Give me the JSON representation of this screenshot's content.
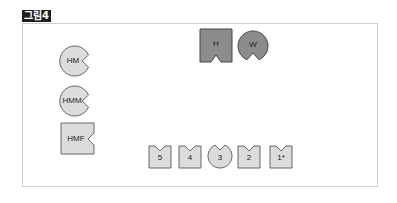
{
  "figure_label": "그림4",
  "colors": {
    "dark_fill": "#8c8c8c",
    "light_fill": "#dcdcdc",
    "stroke": "#555555",
    "frame": "#cfcfcf"
  },
  "top_pieces": [
    {
      "id": "H",
      "label": "H",
      "shape": "square-notch-bottom",
      "fill": "dark"
    },
    {
      "id": "W",
      "label": "W",
      "shape": "circle-notch-bottom",
      "fill": "dark"
    }
  ],
  "left_pieces": [
    {
      "id": "HM",
      "label": "HM",
      "shape": "circle-notch-right"
    },
    {
      "id": "HMM",
      "label": "HMM",
      "shape": "circle-notch-right"
    },
    {
      "id": "HMF",
      "label": "HMF",
      "shape": "square-notch-right"
    }
  ],
  "bottom_pieces": [
    {
      "id": "5",
      "label": "5",
      "shape": "square-notch-top"
    },
    {
      "id": "4",
      "label": "4",
      "shape": "square-notch-top"
    },
    {
      "id": "3",
      "label": "3",
      "shape": "circle-notch-top"
    },
    {
      "id": "2",
      "label": "2",
      "shape": "square-notch-top"
    },
    {
      "id": "1",
      "label": "1*",
      "shape": "square-notch-top"
    }
  ]
}
